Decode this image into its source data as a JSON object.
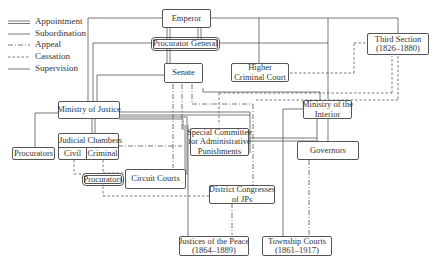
{
  "legend": {
    "items": [
      {
        "label": "Appointment",
        "style": "double"
      },
      {
        "label": "Subordination",
        "style": "solid"
      },
      {
        "label": "Appeal",
        "style": "dash-dot"
      },
      {
        "label": "Cassation",
        "style": "dashed"
      },
      {
        "label": "Supervision",
        "style": "solid"
      }
    ]
  },
  "nodes": {
    "emperor": "Emperor",
    "procurator_general": "Procurator General",
    "senate": "Senate",
    "higher_criminal_court": {
      "line1": "Higher",
      "line2": "Criminal Court"
    },
    "third_section": {
      "line1": "Third Section",
      "line2": "(1826–1880)"
    },
    "ministry_of_justice": "Ministry of Justice",
    "ministry_of_interior": {
      "line1": "Ministry of the",
      "line2": "Interior"
    },
    "judicial_chambers": {
      "title": "Judicial Chambers",
      "civil": "Civil",
      "criminal": "Criminal"
    },
    "procurators_left": "Procurators",
    "procurators_inner": "Procurators",
    "circuit_courts": "Circuit Courts",
    "special_committee": {
      "line1": "Special Committee",
      "line2": "for Administrative",
      "line3": "Punishments"
    },
    "governors": "Governors",
    "district_congresses": {
      "line1": "District Congresses",
      "line2": "of JPs"
    },
    "justices_of_peace": {
      "line1": "Justices of the Peace",
      "line2": "(1864–1889)"
    },
    "township_courts": {
      "line1": "Township Courts",
      "line2": "(1861–1917)"
    }
  },
  "colors": {
    "line": "#555555",
    "text": "#333333",
    "background": "#ffffff"
  }
}
